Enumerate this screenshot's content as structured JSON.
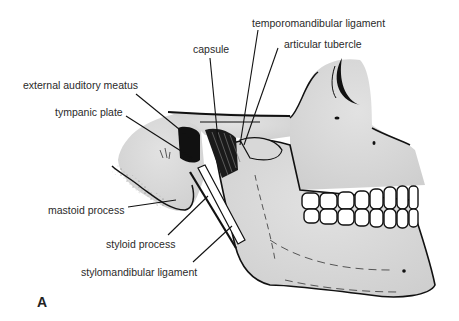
{
  "figure": {
    "panel_letter": "A",
    "labels": [
      {
        "id": "temporomandibular-ligament",
        "text": "temporomandibular ligament"
      },
      {
        "id": "capsule",
        "text": "capsule"
      },
      {
        "id": "articular-tubercle",
        "text": "articular tubercle"
      },
      {
        "id": "external-auditory-meatus",
        "text": "external auditory meatus"
      },
      {
        "id": "tympanic-plate",
        "text": "tympanic plate"
      },
      {
        "id": "mastoid-process",
        "text": "mastoid process"
      },
      {
        "id": "styloid-process",
        "text": "styloid process"
      },
      {
        "id": "stylomandibular-ligament",
        "text": "stylomandibular ligament"
      }
    ]
  },
  "colors": {
    "bone": "#d4d4d4",
    "bone_light": "#e6e6e6",
    "outline": "#111111",
    "teeth": "#ffffff",
    "text": "#2a2a2a"
  }
}
